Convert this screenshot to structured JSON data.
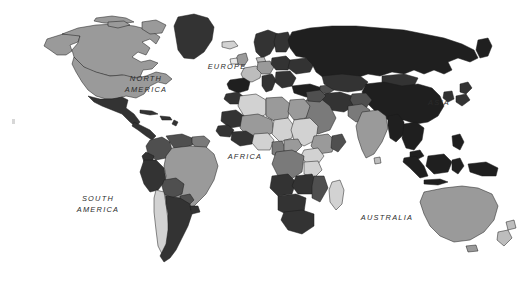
{
  "map": {
    "title": "World Map",
    "type": "choropleth",
    "projection": "equirectangular-ish",
    "width": 528,
    "height": 293,
    "background_color": "#ffffff",
    "stroke_color": "#1a1a1a",
    "shades": {
      "very_light": "#e8e8e8",
      "light": "#d2d2d2",
      "light_mid": "#bdbdbd",
      "mid": "#9a9a9a",
      "mid_dark": "#7a7a7a",
      "dark": "#4f4f4f",
      "very_dark": "#333333",
      "near_black": "#1f1f1f"
    },
    "labels": [
      {
        "id": "north-america",
        "text": "NORTH\nAMERICA",
        "x": 143,
        "y": 79,
        "lines": 2
      },
      {
        "id": "south-america",
        "text": "SOUTH\nAMERICA",
        "x": 96,
        "y": 199,
        "lines": 2
      },
      {
        "id": "europe",
        "text": "EUROPE",
        "x": 204,
        "y": 63,
        "lines": 1
      },
      {
        "id": "africa",
        "text": "AFRICA",
        "x": 224,
        "y": 153,
        "lines": 1
      },
      {
        "id": "asia",
        "text": "ASIA",
        "x": 425,
        "y": 99,
        "lines": 1
      },
      {
        "id": "australia",
        "text": "AUSTRALIA",
        "x": 360,
        "y": 214,
        "lines": 1
      }
    ],
    "regions": [
      {
        "name": "greenland",
        "shade": "very_dark"
      },
      {
        "name": "canada",
        "shade": "mid"
      },
      {
        "name": "united-states",
        "shade": "mid"
      },
      {
        "name": "alaska",
        "shade": "mid"
      },
      {
        "name": "mexico",
        "shade": "very_dark"
      },
      {
        "name": "central-america",
        "shade": "very_dark"
      },
      {
        "name": "caribbean",
        "shade": "very_dark"
      },
      {
        "name": "colombia",
        "shade": "dark"
      },
      {
        "name": "venezuela",
        "shade": "dark"
      },
      {
        "name": "guianas",
        "shade": "mid_dark"
      },
      {
        "name": "brazil",
        "shade": "mid"
      },
      {
        "name": "peru",
        "shade": "very_dark"
      },
      {
        "name": "bolivia",
        "shade": "dark"
      },
      {
        "name": "chile",
        "shade": "light"
      },
      {
        "name": "argentina",
        "shade": "very_dark"
      },
      {
        "name": "iceland",
        "shade": "light"
      },
      {
        "name": "united-kingdom",
        "shade": "mid"
      },
      {
        "name": "scandinavia",
        "shade": "very_dark"
      },
      {
        "name": "france",
        "shade": "light_mid"
      },
      {
        "name": "iberia",
        "shade": "near_black"
      },
      {
        "name": "germany",
        "shade": "mid"
      },
      {
        "name": "italy",
        "shade": "very_dark"
      },
      {
        "name": "eastern-europe",
        "shade": "very_dark"
      },
      {
        "name": "turkey",
        "shade": "near_black"
      },
      {
        "name": "russia",
        "shade": "near_black"
      },
      {
        "name": "kazakhstan",
        "shade": "very_dark"
      },
      {
        "name": "china",
        "shade": "near_black"
      },
      {
        "name": "mongolia",
        "shade": "very_dark"
      },
      {
        "name": "japan",
        "shade": "very_dark"
      },
      {
        "name": "korea",
        "shade": "very_dark"
      },
      {
        "name": "india",
        "shade": "mid"
      },
      {
        "name": "pakistan",
        "shade": "mid_dark"
      },
      {
        "name": "iran",
        "shade": "very_dark"
      },
      {
        "name": "arabia",
        "shade": "mid_dark"
      },
      {
        "name": "southeast-asia",
        "shade": "near_black"
      },
      {
        "name": "indonesia",
        "shade": "near_black"
      },
      {
        "name": "philippines",
        "shade": "near_black"
      },
      {
        "name": "papua-new-guinea",
        "shade": "near_black"
      },
      {
        "name": "australia",
        "shade": "mid"
      },
      {
        "name": "new-zealand",
        "shade": "light_mid"
      },
      {
        "name": "morocco",
        "shade": "very_dark"
      },
      {
        "name": "algeria",
        "shade": "light"
      },
      {
        "name": "libya",
        "shade": "mid"
      },
      {
        "name": "egypt",
        "shade": "mid"
      },
      {
        "name": "sudan",
        "shade": "light"
      },
      {
        "name": "sahel",
        "shade": "mid"
      },
      {
        "name": "west-africa",
        "shade": "very_dark"
      },
      {
        "name": "nigeria",
        "shade": "light"
      },
      {
        "name": "ethiopia",
        "shade": "mid"
      },
      {
        "name": "dr-congo",
        "shade": "mid_dark"
      },
      {
        "name": "east-africa",
        "shade": "light"
      },
      {
        "name": "angola",
        "shade": "very_dark"
      },
      {
        "name": "zambia",
        "shade": "very_dark"
      },
      {
        "name": "madagascar",
        "shade": "light"
      },
      {
        "name": "south-africa",
        "shade": "very_dark"
      }
    ]
  }
}
